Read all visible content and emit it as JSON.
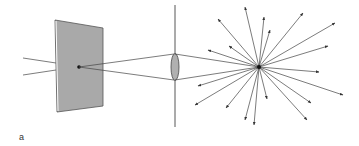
{
  "figure": {
    "panel_label": "a",
    "colors": {
      "line": "#333333",
      "plate_fill": "#a9a9a9",
      "plate_edge": "#555555",
      "lens_fill": "#b0b0b0",
      "background": "#ffffff"
    },
    "elements": [
      {
        "name": "incoming-rays",
        "count": 2
      },
      {
        "name": "plate-with-point-source"
      },
      {
        "name": "lens-on-optical-axis"
      },
      {
        "name": "focal-point-starburst",
        "arrow_count": 18
      }
    ]
  }
}
